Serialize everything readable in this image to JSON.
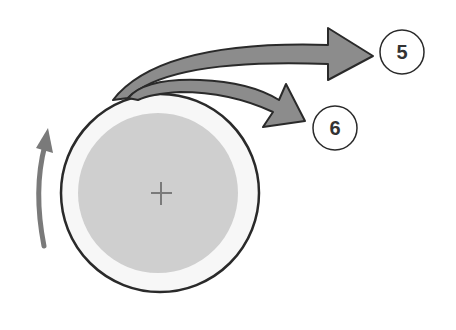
{
  "diagram": {
    "wheel": {
      "center_marker": "+"
    },
    "labels": [
      {
        "id": "arrow-5",
        "text": "5"
      },
      {
        "id": "arrow-6",
        "text": "6"
      }
    ],
    "rotation_direction": "counterclockwise",
    "colors": {
      "wheel_fill": "#cfcfcf",
      "wheel_rim": "#f7f7f7",
      "outline": "#2a2a2a",
      "arrow_fill": "#8c8c8c",
      "rotation_arrow": "#7a7a7a"
    }
  }
}
